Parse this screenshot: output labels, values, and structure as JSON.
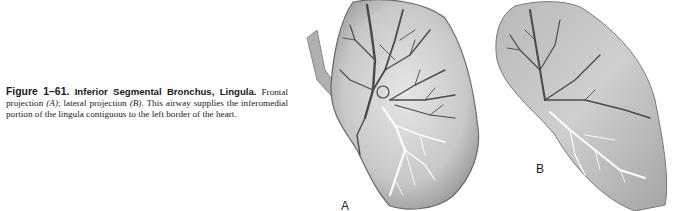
{
  "caption": {
    "figure_number": "Figure 1–61.",
    "title": "Inferior Segmental Bronchus, Lingula.",
    "text_part1": "Frontal projection ",
    "label_a_ref": "(A)",
    "text_part2": "; lateral projection ",
    "label_b_ref": "(B)",
    "text_part3": ". This airway supplies the inferomedial portion of the lingula contiguous to the left border of the heart."
  },
  "panels": [
    {
      "id": "A",
      "label": "A",
      "description": "Frontal projection of left lung lingula bronchial tree"
    },
    {
      "id": "B",
      "label": "B",
      "description": "Lateral projection of left lung lingula bronchial tree"
    }
  ],
  "colors": {
    "lung_fill": "#c9c9c9",
    "airway_dark": "#4a4a4a",
    "highlight_airway": "#ffffff"
  }
}
